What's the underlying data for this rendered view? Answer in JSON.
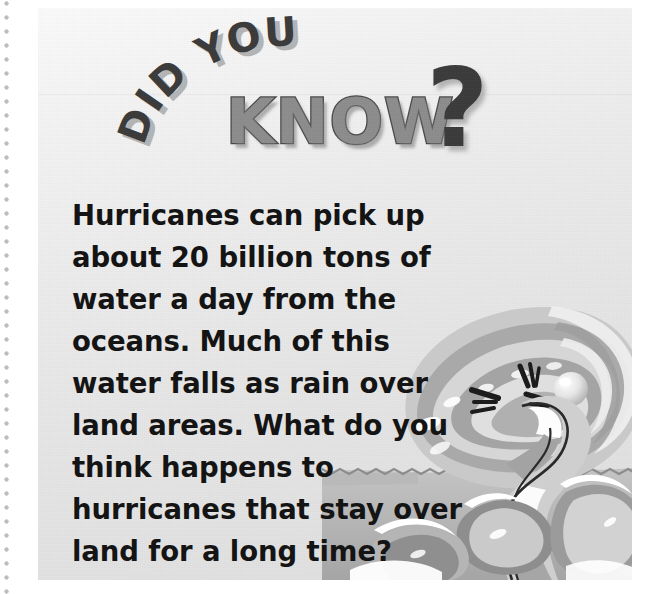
{
  "page": {
    "background_color": "#ffffff",
    "gutter": {
      "name": "dotted-rule",
      "color": "#b9b9b9"
    }
  },
  "panel": {
    "background_color": "#eaeaea",
    "border_color": "#e0e0e0"
  },
  "headline": {
    "arc_text": "DID YOU",
    "main_word": "KNOW",
    "punctuation": "?",
    "arc_color": "#3b3b3b",
    "main_word_color": "#8d8d8d",
    "main_word_outline_color": "#4a4a4a",
    "punctuation_color": "#3b3b3b"
  },
  "body": {
    "text": "    Hurricanes can pick up about 20 billion tons of water a day from the oceans. Much of this water falls as rain over land areas. What do you think happens to hurricanes that stay over land for a long time?",
    "lines": [
      "    Hurricanes can pick up about 20",
      "billion tons of water a day from",
      "the oceans. Much of this water",
      "falls as rain over land areas.",
      "What do you think",
      "happens to hurricanes",
      "that stay over land",
      "for a long time?"
    ],
    "text_color": "#141414"
  },
  "illustration": {
    "name": "cartoon-hurricane-over-ocean",
    "description": "Grayscale cartoon hurricane with an angry face and a funnel, churning ocean waves below",
    "colors": {
      "swirl_dark": "#8f8f8f",
      "swirl_mid": "#b4b4b4",
      "swirl_light": "#dedede",
      "foam_white": "#ffffff",
      "water_dark": "#9a9a9a",
      "water_mid": "#bdbdbd",
      "outline": "#1c1c1c",
      "eye_highlight": "#f2f2f2"
    }
  }
}
